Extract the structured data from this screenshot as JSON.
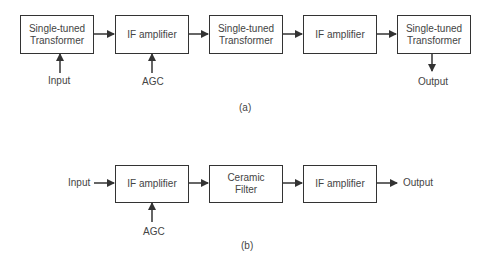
{
  "diagram_a": {
    "caption": "(a)",
    "blocks": [
      {
        "label": "Single-tuned\nTransformer"
      },
      {
        "label": "IF amplifier"
      },
      {
        "label": "Single-tuned\nTransformer"
      },
      {
        "label": "IF amplifier"
      },
      {
        "label": "Single-tuned\nTransformer"
      }
    ],
    "input_label": "Input",
    "agc_label": "AGC",
    "output_label": "Output"
  },
  "diagram_b": {
    "caption": "(b)",
    "blocks": [
      {
        "label": "IF amplifier"
      },
      {
        "label": "Ceramic\nFilter"
      },
      {
        "label": "IF amplifier"
      }
    ],
    "input_label": "Input",
    "agc_label": "AGC",
    "output_label": "Output"
  },
  "colors": {
    "line": "#333333",
    "text": "#444444",
    "background": "#ffffff"
  }
}
